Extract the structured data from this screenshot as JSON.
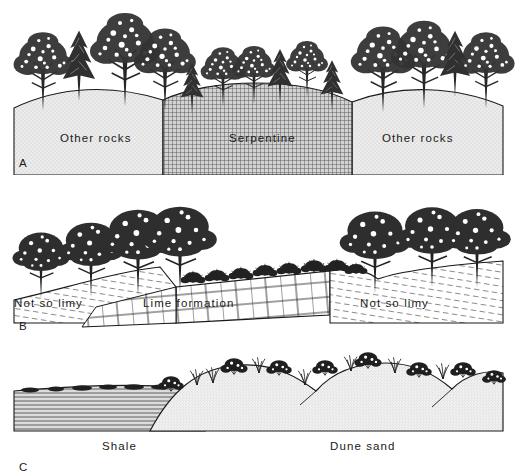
{
  "figure": {
    "background_color": "#ffffff",
    "ink_color": "#1a1a1a",
    "style": "pen-and-ink scientific cross-section illustration"
  },
  "panels": [
    {
      "letter": "A",
      "theme": "serpentine-soil vegetation contrast",
      "labels": [
        {
          "text": "Other rocks",
          "x": 60,
          "y": 139
        },
        {
          "text": "Serpentine",
          "x": 229,
          "y": 139
        },
        {
          "text": "Other rocks",
          "x": 382,
          "y": 139
        }
      ],
      "substrates": [
        {
          "name": "Other rocks",
          "texture": "fine-stipple",
          "fill": "#e9e9e9"
        },
        {
          "name": "Serpentine",
          "texture": "cross-hatch-grid",
          "fill": "#bfbfbf"
        },
        {
          "name": "Other rocks",
          "texture": "fine-stipple",
          "fill": "#e9e9e9"
        }
      ],
      "vegetation": {
        "other_rocks": "tall dense mixed broadleaf and conifer forest",
        "serpentine": "shorter sparser trees, mostly conifers"
      }
    },
    {
      "letter": "B",
      "theme": "limestone outcrop vegetation contrast",
      "labels": [
        {
          "text": "Not so limy",
          "x": 14,
          "y": 303
        },
        {
          "text": "Lime formation",
          "x": 143,
          "y": 303
        },
        {
          "text": "Not so limy",
          "x": 360,
          "y": 303
        }
      ],
      "substrates": [
        {
          "name": "Not so limy",
          "texture": "diagonal-dash-hatch",
          "fill": "#ffffff"
        },
        {
          "name": "Lime formation",
          "texture": "brick-blocks",
          "fill": "#ffffff"
        },
        {
          "name": "Not so limy",
          "texture": "diagonal-dash-hatch",
          "fill": "#ffffff"
        }
      ],
      "vegetation": {
        "not_so_limy": "tall broadleaf trees",
        "lime_formation": "low shrubs and scrub on bare ledge"
      }
    },
    {
      "letter": "C",
      "theme": "shale to dune sand vegetation contrast",
      "labels": [
        {
          "text": "Shale",
          "x": 102,
          "y": 446
        },
        {
          "text": "Dune sand",
          "x": 330,
          "y": 446
        }
      ],
      "substrates": [
        {
          "name": "Shale",
          "texture": "horizontal-laminations",
          "fill": "#d9d9d9"
        },
        {
          "name": "Dune sand",
          "texture": "dense-stipple",
          "fill": "#efefef"
        }
      ],
      "vegetation": {
        "shale": "low matted ground cover",
        "dune_sand": "scattered shrub clumps and bunch grasses"
      }
    }
  ]
}
